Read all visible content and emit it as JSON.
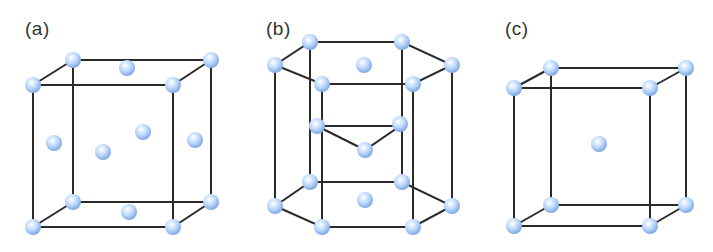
{
  "panels": [
    {
      "id": "a",
      "label": "(a)",
      "structure": "face-centered cubic"
    },
    {
      "id": "b",
      "label": "(b)",
      "structure": "hexagonal close-packed"
    },
    {
      "id": "c",
      "label": "(c)",
      "structure": "body-centered cubic"
    }
  ],
  "colors": {
    "edge": "#2a2a2a",
    "atom_light": "#ffffff",
    "atom_mid": "#b9d6fb",
    "atom_dark": "#7fa9e6"
  }
}
